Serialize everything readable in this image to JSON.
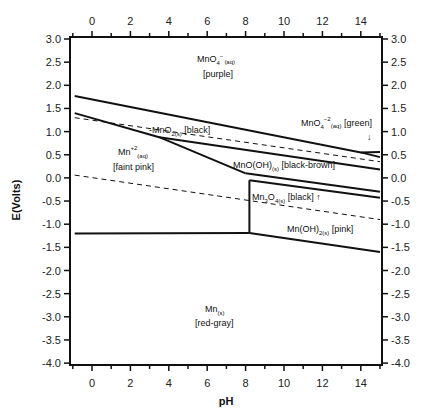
{
  "chart_data": {
    "type": "line",
    "title": "",
    "xlabel": "pH",
    "ylabel": "E(Volts)",
    "xlim": [
      -1,
      15
    ],
    "ylim": [
      -4.0,
      3.0
    ],
    "grid": false,
    "x_ticks": [
      0,
      2,
      4,
      6,
      8,
      10,
      12,
      14
    ],
    "y_ticks": [
      "3.0",
      "2.5",
      "2.0",
      "1.5",
      "1.0",
      "0.5",
      "0.0",
      "-0.5",
      "-1.0",
      "-1.5",
      "-2.0",
      "-2.5",
      "-3.0",
      "-3.5",
      "-4.0"
    ],
    "series": [
      {
        "name": "MnO4- / MnO2 boundary",
        "style": "solid",
        "points": [
          [
            -0.9,
            1.77
          ],
          [
            14,
            0.55
          ],
          [
            15,
            0.56
          ]
        ]
      },
      {
        "name": "MnO4-2 / MnO2 boundary",
        "style": "solid",
        "points": [
          [
            14,
            0.55
          ],
          [
            15,
            0.45
          ]
        ]
      },
      {
        "name": "MnO2 / Mn+2 boundary",
        "style": "solid",
        "points": [
          [
            -0.9,
            1.4
          ],
          [
            3.5,
            0.88
          ],
          [
            8.0,
            0.1
          ]
        ]
      },
      {
        "name": "MnO2 / MnO(OH) boundary",
        "style": "solid",
        "points": [
          [
            3.5,
            0.88
          ],
          [
            15,
            0.18
          ]
        ]
      },
      {
        "name": "MnO(OH) / Mn3O4 upper",
        "style": "solid",
        "points": [
          [
            8.0,
            0.1
          ],
          [
            15,
            -0.3
          ]
        ]
      },
      {
        "name": "Mn3O4 lower boundary",
        "style": "solid",
        "points": [
          [
            8.2,
            -0.05
          ],
          [
            15,
            -0.43
          ]
        ]
      },
      {
        "name": "Mn+2 / Mn3O4 vertical",
        "style": "solid",
        "points": [
          [
            8.2,
            -0.05
          ],
          [
            8.2,
            -1.19
          ]
        ]
      },
      {
        "name": "Mn+2 / Mn boundary",
        "style": "solid",
        "points": [
          [
            -0.9,
            -1.2
          ],
          [
            8.2,
            -1.19
          ]
        ]
      },
      {
        "name": "Mn(OH)2 / Mn boundary",
        "style": "solid",
        "points": [
          [
            8.2,
            -1.19
          ],
          [
            15,
            -1.6
          ]
        ]
      },
      {
        "name": "O2/H2O water line",
        "style": "dashed",
        "points": [
          [
            -0.9,
            1.3
          ],
          [
            15,
            0.35
          ]
        ]
      },
      {
        "name": "H2O/H2 water line",
        "style": "dashed",
        "points": [
          [
            -0.9,
            0.06
          ],
          [
            15,
            -0.9
          ]
        ]
      }
    ],
    "annotations": [
      {
        "text": "MnO4-(aq)",
        "main": "MnO",
        "sub1": "4",
        "sup": "−",
        "sub2": "(aq)",
        "line2": "[purple]",
        "x": 6.8,
        "y": 2.5
      },
      {
        "text": "MnO2(s) [black]",
        "x": 5.5,
        "y": 1.05
      },
      {
        "text": "Mn+2(aq) [faint pink]",
        "x": 1.5,
        "y": 0.6
      },
      {
        "text": "MnO4-2(aq) [green]",
        "x": 12.2,
        "y": 1.1
      },
      {
        "text": "MnO(OH)(s) [black-brown]",
        "x": 11.0,
        "y": 0.2
      },
      {
        "text": "Mn3O4(s) [black]",
        "x": 10.3,
        "y": -0.35
      },
      {
        "text": "Mn(OH)2(s) [pink]",
        "x": 12.5,
        "y": -1.0
      },
      {
        "text": "Mn(s) [red-gray]",
        "x": 6.8,
        "y": -3.0
      }
    ]
  },
  "labels": {
    "xlabel": "pH",
    "ylabel": "E(Volts)",
    "mno4": {
      "main": "MnO",
      "sub": "4",
      "sup": "−",
      "phase": "(aq)",
      "color": "[purple]"
    },
    "mno2": {
      "prefix": "-MnO",
      "sub": "2(s)",
      "color": " [black]"
    },
    "mn2": {
      "main": "Mn",
      "sup": "+2",
      "phase": "(aq)",
      "color": "[faint pink]"
    },
    "mno4_2": {
      "main": "MnO",
      "sub": "4",
      "sup": "−2",
      "phase": "(aq)",
      "color": " [green]",
      "arrow": "↓"
    },
    "mnooh": {
      "main": "MnO(OH)",
      "sub": "(s)",
      "color": " [black-brown]"
    },
    "mn3o4": {
      "main": "Mn",
      "sub1": "3",
      "mid": "O",
      "sub2": "4(s)",
      "color": " [black]",
      "arrow": " ↑"
    },
    "mnoh2": {
      "main": "Mn(OH)",
      "sub": "2(s)",
      "color": " [pink]"
    },
    "mn": {
      "main": "Mn",
      "sub": "(s)",
      "color": "[red-gray]"
    }
  }
}
